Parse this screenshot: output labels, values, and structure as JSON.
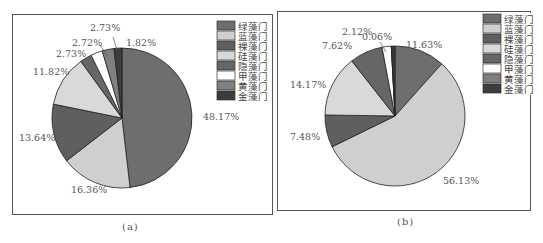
{
  "chart_data": [
    {
      "type": "pie",
      "title": "",
      "caption": "(a)",
      "categories": [
        "绿藻门",
        "蓝藻门",
        "裸藻门",
        "硅藻门",
        "隐藻门",
        "甲藻门",
        "黄藻门",
        "金藻门"
      ],
      "values": [
        48.17,
        16.36,
        13.64,
        11.82,
        2.73,
        2.72,
        2.73,
        1.82
      ],
      "labels": [
        "48.17%",
        "16.36%",
        "13.64%",
        "11.82%",
        "2.73%",
        "2.72%",
        "2.73%",
        "1.82%"
      ],
      "legend_position": "top-right",
      "start": "top",
      "direction": "clockwise"
    },
    {
      "type": "pie",
      "title": "",
      "caption": "(b)",
      "categories": [
        "绿藻门",
        "蓝藻门",
        "裸藻门",
        "硅藻门",
        "隐藻门",
        "甲藻门",
        "黄藻门",
        "金藻门"
      ],
      "values": [
        11.63,
        56.13,
        7.48,
        14.17,
        7.62,
        2.12,
        0.06,
        0.79
      ],
      "labels": [
        "11.63%",
        "56.13%",
        "7.48%",
        "14.17%",
        "7.62%",
        "2.12%",
        "0.06%",
        ""
      ],
      "legend_position": "top-right",
      "start": "top",
      "direction": "clockwise"
    }
  ],
  "colors": [
    "#6e6e6e",
    "#cfcfcf",
    "#5f5f5f",
    "#d9d9d9",
    "#666666",
    "#ffffff",
    "#808080",
    "#3c3c3c"
  ]
}
